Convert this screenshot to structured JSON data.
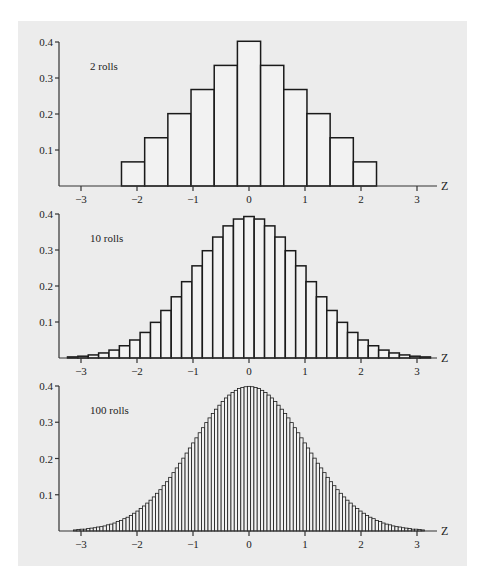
{
  "colors": {
    "panel": "#ececec",
    "bar_fill": "#f2f2f2",
    "bar_stroke": "#1a1a1a",
    "axis": "#333333"
  },
  "chart_data": [
    {
      "type": "bar",
      "title": "2 rolls",
      "xlabel": "Z",
      "ylabel": "",
      "xlim": [
        -3.2,
        3.4
      ],
      "ylim": [
        0,
        0.4
      ],
      "x_ticks": [
        -3,
        -2,
        -1,
        0,
        1,
        2,
        3
      ],
      "x_tick_labels": [
        "−3",
        "−2",
        "−1",
        "0",
        "1",
        "2",
        "3"
      ],
      "y_ticks": [
        0.1,
        0.2,
        0.3,
        0.4
      ],
      "y_tick_labels": [
        "0.1",
        "0.2",
        "0.3",
        "0.4"
      ],
      "grid": false,
      "bin_width": 0.414,
      "x": [
        -2.07,
        -1.656,
        -1.242,
        -0.828,
        -0.414,
        0,
        0.414,
        0.828,
        1.242,
        1.656,
        2.07
      ],
      "values": [
        0.067,
        0.134,
        0.201,
        0.268,
        0.335,
        0.402,
        0.335,
        0.268,
        0.201,
        0.134,
        0.067
      ]
    },
    {
      "type": "bar",
      "title": "10 rolls",
      "xlabel": "Z",
      "ylabel": "",
      "xlim": [
        -3.2,
        3.4
      ],
      "ylim": [
        0,
        0.4
      ],
      "x_ticks": [
        -3,
        -2,
        -1,
        0,
        1,
        2,
        3
      ],
      "x_tick_labels": [
        "−3",
        "−2",
        "−1",
        "0",
        "1",
        "2",
        "3"
      ],
      "y_ticks": [
        0.1,
        0.2,
        0.3,
        0.4
      ],
      "y_tick_labels": [
        "0.1",
        "0.2",
        "0.3",
        "0.4"
      ],
      "grid": false,
      "bin_width": 0.1852,
      "center_index": 17,
      "values": [
        0.003,
        0.005,
        0.0085,
        0.014,
        0.022,
        0.034,
        0.05,
        0.071,
        0.099,
        0.132,
        0.17,
        0.212,
        0.256,
        0.298,
        0.336,
        0.367,
        0.386,
        0.393,
        0.386,
        0.367,
        0.336,
        0.298,
        0.256,
        0.212,
        0.17,
        0.132,
        0.099,
        0.071,
        0.05,
        0.034,
        0.022,
        0.014,
        0.0085,
        0.005,
        0.003
      ]
    },
    {
      "type": "bar",
      "title": "100 rolls",
      "xlabel": "Z",
      "ylabel": "",
      "xlim": [
        -3.2,
        3.4
      ],
      "ylim": [
        0,
        0.4
      ],
      "x_ticks": [
        -3,
        -2,
        -1,
        0,
        1,
        2,
        3
      ],
      "x_tick_labels": [
        "−3",
        "−2",
        "−1",
        "0",
        "1",
        "2",
        "3"
      ],
      "y_ticks": [
        0.1,
        0.2,
        0.3,
        0.4
      ],
      "y_tick_labels": [
        "0.1",
        "0.2",
        "0.3",
        "0.4"
      ],
      "grid": false,
      "bin_width": 0.05855,
      "center_index": 53,
      "values": [
        0.003,
        0.004,
        0.005,
        0.005,
        0.007,
        0.008,
        0.009,
        0.011,
        0.012,
        0.014,
        0.017,
        0.019,
        0.022,
        0.026,
        0.029,
        0.034,
        0.038,
        0.043,
        0.049,
        0.055,
        0.062,
        0.069,
        0.077,
        0.085,
        0.094,
        0.104,
        0.114,
        0.125,
        0.136,
        0.148,
        0.161,
        0.174,
        0.187,
        0.201,
        0.215,
        0.229,
        0.243,
        0.257,
        0.271,
        0.285,
        0.299,
        0.312,
        0.324,
        0.336,
        0.347,
        0.357,
        0.367,
        0.375,
        0.382,
        0.388,
        0.393,
        0.396,
        0.398,
        0.399,
        0.398,
        0.396,
        0.393,
        0.388,
        0.382,
        0.375,
        0.367,
        0.357,
        0.347,
        0.336,
        0.324,
        0.312,
        0.299,
        0.285,
        0.271,
        0.257,
        0.243,
        0.229,
        0.215,
        0.201,
        0.187,
        0.174,
        0.161,
        0.148,
        0.136,
        0.125,
        0.114,
        0.104,
        0.094,
        0.085,
        0.077,
        0.069,
        0.062,
        0.055,
        0.049,
        0.043,
        0.038,
        0.034,
        0.029,
        0.026,
        0.022,
        0.019,
        0.017,
        0.014,
        0.012,
        0.011,
        0.009,
        0.008,
        0.007,
        0.005,
        0.005,
        0.004,
        0.003
      ]
    }
  ]
}
